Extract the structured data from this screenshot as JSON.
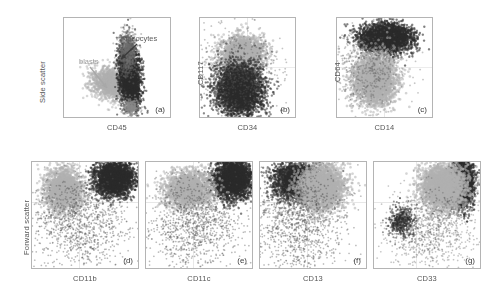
{
  "figure": {
    "background": "#ffffff",
    "colors": {
      "blast_population": "#b0b0b0",
      "monocyte_population": "#2b2b2b",
      "axis_line": "#b4b4b4",
      "gridline": "#d9d9d9",
      "label_text": "#555555"
    }
  },
  "axis_labels": {
    "side_scatter": "Side scatter",
    "forward_scatter": "Forward scatter"
  },
  "annotations": {
    "blasts": "blasts",
    "monocytes": "monocytes"
  },
  "chart_data": [
    {
      "id": "a",
      "type": "scatter",
      "letter": "(a)",
      "xlabel": "CD45",
      "ylabel": "Side scatter",
      "xlim": [
        0,
        100
      ],
      "ylim": [
        0,
        100
      ],
      "grid": false,
      "annotations": [
        "blasts",
        "monocytes"
      ],
      "series": [
        {
          "name": "blasts",
          "color": "#b0b0b0",
          "n": 1400,
          "cx": 44,
          "cy": 34,
          "sx": 9.5,
          "sy": 7.5,
          "rot": -18,
          "dot": 1.25,
          "alpha": 0.5
        },
        {
          "name": "monocytes",
          "color": "#2b2b2b",
          "n": 2600,
          "cx": 62,
          "cy": 42,
          "sx": 5.0,
          "sy": 16.0,
          "rot": 4,
          "dot": 1.1,
          "alpha": 0.6
        },
        {
          "name": "granulocytes-tail",
          "color": "#6e6e6e",
          "n": 700,
          "cx": 60,
          "cy": 66,
          "sx": 4.0,
          "sy": 11.0,
          "rot": 0,
          "dot": 1.0,
          "alpha": 0.4
        },
        {
          "name": "lymphocyte-gate",
          "color": "#8a8a8a",
          "n": 260,
          "cx": 63,
          "cy": 10,
          "sx": 3.6,
          "sy": 4.2,
          "rot": 0,
          "dot": 1.0,
          "alpha": 0.5
        }
      ]
    },
    {
      "id": "b",
      "type": "scatter",
      "letter": "(b)",
      "xlabel": "CD34",
      "ylabel": "CD117",
      "xlim": [
        0,
        100
      ],
      "ylim": [
        0,
        100
      ],
      "grid": true,
      "gridx": 50,
      "gridy": 50,
      "annotations": [],
      "series": [
        {
          "name": "blasts",
          "color": "#b0b0b0",
          "n": 2200,
          "cx": 44,
          "cy": 63,
          "sx": 11.0,
          "sy": 9.0,
          "rot": 0,
          "dot": 1.3,
          "alpha": 0.55
        },
        {
          "name": "monocytes",
          "color": "#2b2b2b",
          "n": 3400,
          "cx": 42,
          "cy": 28,
          "sx": 13.0,
          "sy": 13.0,
          "rot": 0,
          "dot": 1.15,
          "alpha": 0.55
        },
        {
          "name": "scatter-noise",
          "color": "#565656",
          "n": 600,
          "cx": 38,
          "cy": 48,
          "sx": 24.0,
          "sy": 22.0,
          "rot": 0,
          "dot": 0.9,
          "alpha": 0.35
        }
      ]
    },
    {
      "id": "c",
      "type": "scatter",
      "letter": "(c)",
      "xlabel": "CD14",
      "ylabel": "CD64",
      "xlim": [
        0,
        100
      ],
      "ylim": [
        0,
        100
      ],
      "grid": true,
      "gridx": 50,
      "gridy": 50,
      "annotations": [],
      "series": [
        {
          "name": "monocytes",
          "color": "#2b2b2b",
          "n": 3000,
          "cx": 52,
          "cy": 80,
          "sx": 13.0,
          "sy": 7.0,
          "rot": 0,
          "dot": 1.2,
          "alpha": 0.6
        },
        {
          "name": "blasts",
          "color": "#b0b0b0",
          "n": 2600,
          "cx": 40,
          "cy": 38,
          "sx": 11.0,
          "sy": 13.0,
          "rot": 0,
          "dot": 1.3,
          "alpha": 0.55
        },
        {
          "name": "scatter-noise",
          "color": "#5c5c5c",
          "n": 550,
          "cx": 34,
          "cy": 50,
          "sx": 20.0,
          "sy": 22.0,
          "rot": 0,
          "dot": 0.9,
          "alpha": 0.35
        }
      ]
    },
    {
      "id": "d",
      "type": "scatter",
      "letter": "(d)",
      "xlabel": "CD11b",
      "ylabel": "Forward scatter",
      "xlim": [
        0,
        100
      ],
      "ylim": [
        0,
        100
      ],
      "grid": true,
      "gridx": 45,
      "gridy": 62,
      "annotations": [],
      "series": [
        {
          "name": "monocytes",
          "color": "#2b2b2b",
          "n": 2600,
          "cx": 78,
          "cy": 84,
          "sx": 9.0,
          "sy": 8.0,
          "rot": 0,
          "dot": 1.2,
          "alpha": 0.6
        },
        {
          "name": "blasts",
          "color": "#b0b0b0",
          "n": 2000,
          "cx": 30,
          "cy": 74,
          "sx": 9.0,
          "sy": 10.0,
          "rot": 0,
          "dot": 1.25,
          "alpha": 0.55
        },
        {
          "name": "scatter-noise",
          "color": "#4f4f4f",
          "n": 1100,
          "cx": 46,
          "cy": 42,
          "sx": 24.0,
          "sy": 22.0,
          "rot": 0,
          "dot": 0.85,
          "alpha": 0.4
        }
      ]
    },
    {
      "id": "e",
      "type": "scatter",
      "letter": "(e)",
      "xlabel": "CD11c",
      "ylabel": "Forward scatter",
      "xlim": [
        0,
        100
      ],
      "ylim": [
        0,
        100
      ],
      "grid": true,
      "gridx": 45,
      "gridy": 62,
      "annotations": [],
      "series": [
        {
          "name": "monocytes",
          "color": "#2b2b2b",
          "n": 2800,
          "cx": 82,
          "cy": 84,
          "sx": 9.0,
          "sy": 9.0,
          "rot": 0,
          "dot": 1.2,
          "alpha": 0.6
        },
        {
          "name": "blasts",
          "color": "#b0b0b0",
          "n": 1900,
          "cx": 40,
          "cy": 74,
          "sx": 11.0,
          "sy": 9.0,
          "rot": 0,
          "dot": 1.25,
          "alpha": 0.55
        },
        {
          "name": "scatter-noise",
          "color": "#4f4f4f",
          "n": 1100,
          "cx": 48,
          "cy": 42,
          "sx": 24.0,
          "sy": 22.0,
          "rot": 0,
          "dot": 0.85,
          "alpha": 0.4
        }
      ]
    },
    {
      "id": "f",
      "type": "scatter",
      "letter": "(f)",
      "xlabel": "CD13",
      "ylabel": "Forward scatter",
      "xlim": [
        0,
        100
      ],
      "ylim": [
        0,
        100
      ],
      "grid": true,
      "gridx": 45,
      "gridy": 62,
      "annotations": [],
      "series": [
        {
          "name": "monocytes",
          "color": "#2b2b2b",
          "n": 2500,
          "cx": 34,
          "cy": 82,
          "sx": 11.0,
          "sy": 9.0,
          "rot": 0,
          "dot": 1.15,
          "alpha": 0.55
        },
        {
          "name": "blasts",
          "color": "#b0b0b0",
          "n": 2400,
          "cx": 58,
          "cy": 76,
          "sx": 11.0,
          "sy": 11.0,
          "rot": 0,
          "dot": 1.3,
          "alpha": 0.55
        },
        {
          "name": "scatter-noise",
          "color": "#4f4f4f",
          "n": 1200,
          "cx": 36,
          "cy": 42,
          "sx": 22.0,
          "sy": 24.0,
          "rot": 0,
          "dot": 0.85,
          "alpha": 0.4
        }
      ]
    },
    {
      "id": "g",
      "type": "scatter",
      "letter": "(g)",
      "xlabel": "CD33",
      "ylabel": "Forward scatter",
      "xlim": [
        0,
        100
      ],
      "ylim": [
        0,
        100
      ],
      "grid": true,
      "gridx": 40,
      "gridy": 62,
      "annotations": [],
      "series": [
        {
          "name": "monocytes",
          "color": "#2b2b2b",
          "n": 2400,
          "cx": 84,
          "cy": 80,
          "sx": 5.0,
          "sy": 11.0,
          "rot": 0,
          "dot": 1.15,
          "alpha": 0.6
        },
        {
          "name": "blasts",
          "color": "#b0b0b0",
          "n": 2500,
          "cx": 66,
          "cy": 76,
          "sx": 11.0,
          "sy": 11.0,
          "rot": 0,
          "dot": 1.3,
          "alpha": 0.55
        },
        {
          "name": "monocyte-lowfsc",
          "color": "#2b2b2b",
          "n": 500,
          "cx": 26,
          "cy": 44,
          "sx": 6.0,
          "sy": 7.0,
          "rot": 0,
          "dot": 1.0,
          "alpha": 0.5
        },
        {
          "name": "scatter-noise",
          "color": "#575757",
          "n": 900,
          "cx": 54,
          "cy": 36,
          "sx": 22.0,
          "sy": 20.0,
          "rot": 0,
          "dot": 0.85,
          "alpha": 0.35
        }
      ]
    }
  ],
  "layout": {
    "panels": [
      {
        "id": "a",
        "left": 63,
        "top": 17,
        "width": 108,
        "height": 101
      },
      {
        "id": "b",
        "left": 199,
        "top": 17,
        "width": 97,
        "height": 101
      },
      {
        "id": "c",
        "left": 336,
        "top": 17,
        "width": 97,
        "height": 101
      },
      {
        "id": "d",
        "left": 31,
        "top": 161,
        "width": 108,
        "height": 108
      },
      {
        "id": "e",
        "left": 145,
        "top": 161,
        "width": 108,
        "height": 108
      },
      {
        "id": "f",
        "left": 259,
        "top": 161,
        "width": 108,
        "height": 108
      },
      {
        "id": "g",
        "left": 373,
        "top": 161,
        "width": 108,
        "height": 108
      }
    ]
  }
}
